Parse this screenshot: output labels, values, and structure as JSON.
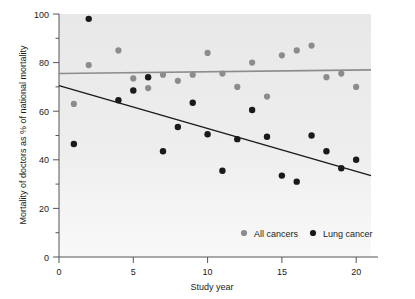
{
  "chart_data": {
    "type": "scatter",
    "title": "",
    "xlabel": "Study year",
    "ylabel": "Mortality of doctors as % of national mortality",
    "xlim": [
      0,
      21
    ],
    "ylim": [
      0,
      100
    ],
    "xticks": [
      0,
      5,
      10,
      15,
      20
    ],
    "xtick_labels": [
      "0",
      "5",
      "10",
      "15",
      "20"
    ],
    "yticks": [
      0,
      20,
      40,
      60,
      80,
      100
    ],
    "ytick_labels": [
      "0",
      "20",
      "40",
      "60",
      "80",
      "100"
    ],
    "yticks_minor": [
      10,
      30,
      50,
      70,
      90
    ],
    "grid": false,
    "legend_position": "inside-bottom-right",
    "plot_background": "#e8e8e8",
    "series": [
      {
        "name": "All cancers",
        "color": "#8c8c8c",
        "marker": "circle",
        "x": [
          1,
          2,
          4,
          5,
          6,
          7,
          8,
          9,
          10,
          11,
          12,
          13,
          14,
          15,
          16,
          17,
          18,
          19,
          20
        ],
        "y": [
          63,
          79,
          85,
          73.5,
          69.5,
          75,
          72.5,
          75,
          84,
          75.5,
          70,
          80,
          66,
          83,
          85,
          87,
          74,
          75.5,
          70
        ],
        "trend": {
          "color": "#8c8c8c",
          "x": [
            0,
            21
          ],
          "y": [
            75.5,
            77
          ]
        }
      },
      {
        "name": "Lung cancer",
        "color": "#1a1a1a",
        "marker": "circle",
        "x": [
          1,
          2,
          4,
          5,
          6,
          7,
          8,
          9,
          10,
          11,
          12,
          13,
          14,
          15,
          16,
          17,
          18,
          19,
          20
        ],
        "y": [
          46.5,
          98,
          64.5,
          68.5,
          74,
          43.5,
          53.5,
          63.5,
          50.5,
          35.5,
          48.5,
          60.5,
          49.5,
          33.5,
          31,
          50,
          43.5,
          36.5,
          40
        ],
        "trend": {
          "color": "#1a1a1a",
          "x": [
            0,
            21
          ],
          "y": [
            70.5,
            33.5
          ]
        }
      }
    ]
  },
  "legend": {
    "items": [
      {
        "label": "All cancers",
        "color": "#8c8c8c"
      },
      {
        "label": "Lung cancer",
        "color": "#1a1a1a"
      }
    ]
  },
  "axes": {
    "x_title": "Study year",
    "y_title": "Mortality of doctors as % of national mortality"
  }
}
